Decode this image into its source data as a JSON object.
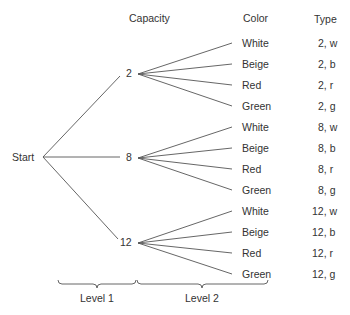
{
  "headers": {
    "capacity": "Capacity",
    "color": "Color",
    "type": "Type"
  },
  "root": {
    "label": "Start"
  },
  "level1_nodes": [
    {
      "label": "2"
    },
    {
      "label": "8"
    },
    {
      "label": "12"
    }
  ],
  "leaves": [
    {
      "color": "White",
      "type": "2, w"
    },
    {
      "color": "Beige",
      "type": "2, b"
    },
    {
      "color": "Red",
      "type": "2, r"
    },
    {
      "color": "Green",
      "type": "2, g"
    },
    {
      "color": "White",
      "type": "8, w"
    },
    {
      "color": "Beige",
      "type": "8, b"
    },
    {
      "color": "Red",
      "type": "8, r"
    },
    {
      "color": "Green",
      "type": "8, g"
    },
    {
      "color": "White",
      "type": "12, w"
    },
    {
      "color": "Beige",
      "type": "12, b"
    },
    {
      "color": "Red",
      "type": "12, r"
    },
    {
      "color": "Green",
      "type": "12, g"
    }
  ],
  "levels": {
    "level1": "Level 1",
    "level2": "Level 2"
  },
  "colors": {
    "line": "#555555",
    "text": "#333333",
    "background": "#ffffff"
  }
}
